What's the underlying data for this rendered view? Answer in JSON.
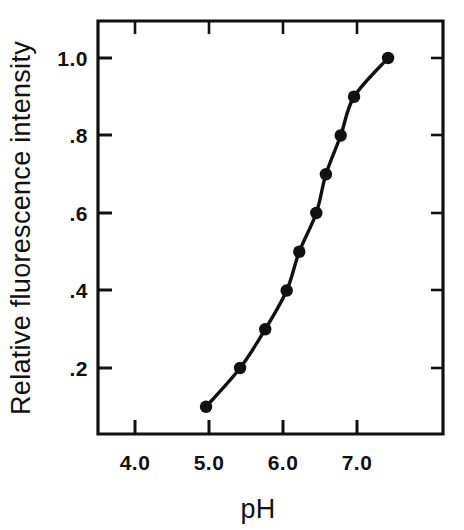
{
  "chart_data": {
    "type": "line",
    "title": "",
    "xlabel": "pH",
    "ylabel": "Relative fluorescence intensity",
    "xlim": [
      3.5,
      8.15
    ],
    "ylim": [
      0.0,
      1.08
    ],
    "grid": false,
    "legend": null,
    "marker": "filled-circle",
    "x": [
      4.96,
      5.42,
      5.76,
      6.05,
      6.22,
      6.45,
      6.58,
      6.78,
      6.96,
      7.42
    ],
    "values": [
      0.1,
      0.2,
      0.3,
      0.4,
      0.5,
      0.6,
      0.7,
      0.8,
      0.9,
      1.0
    ],
    "series": [
      {
        "name": "Relative fluorescence intensity",
        "points": [
          {
            "x": 4.96,
            "y": 0.1
          },
          {
            "x": 5.42,
            "y": 0.2
          },
          {
            "x": 5.76,
            "y": 0.3
          },
          {
            "x": 6.05,
            "y": 0.4
          },
          {
            "x": 6.22,
            "y": 0.5
          },
          {
            "x": 6.45,
            "y": 0.6
          },
          {
            "x": 6.58,
            "y": 0.7
          },
          {
            "x": 6.78,
            "y": 0.8
          },
          {
            "x": 6.96,
            "y": 0.9
          },
          {
            "x": 7.42,
            "y": 1.0
          }
        ]
      }
    ],
    "xticks": [
      {
        "value": 4.0,
        "label": "4.0"
      },
      {
        "value": 5.0,
        "label": "5.0"
      },
      {
        "value": 6.0,
        "label": "6.0"
      },
      {
        "value": 7.0,
        "label": "7.0"
      }
    ],
    "yticks": [
      {
        "value": 0.2,
        "label": ".2"
      },
      {
        "value": 0.4,
        "label": ".4"
      },
      {
        "value": 0.6,
        "label": ".6"
      },
      {
        "value": 0.8,
        "label": ".8"
      },
      {
        "value": 1.0,
        "label": "1.0"
      }
    ],
    "colors": {
      "axis": "#111111",
      "marker": "#111111",
      "line": "#111111",
      "background": "#ffffff"
    }
  },
  "axes": {
    "x_title": "pH",
    "y_title": "Relative fluorescence intensity"
  },
  "xtick_labels": {
    "t0": "4.0",
    "t1": "5.0",
    "t2": "6.0",
    "t3": "7.0"
  },
  "ytick_labels": {
    "t0": ".2",
    "t1": ".4",
    "t2": ".6",
    "t3": ".8",
    "t4": "1.0"
  }
}
